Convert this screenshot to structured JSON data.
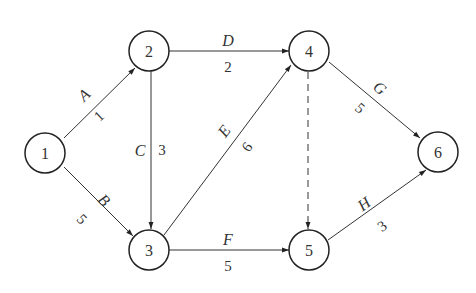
{
  "diagram": {
    "type": "activity-network",
    "nodes": [
      {
        "id": "1",
        "label": "1",
        "x": 50,
        "y": 152
      },
      {
        "id": "2",
        "label": "2",
        "x": 149,
        "y": 51
      },
      {
        "id": "3",
        "label": "3",
        "x": 149,
        "y": 250
      },
      {
        "id": "4",
        "label": "4",
        "x": 309,
        "y": 51
      },
      {
        "id": "5",
        "label": "5",
        "x": 309,
        "y": 250
      },
      {
        "id": "6",
        "label": "6",
        "x": 438,
        "y": 152
      }
    ],
    "edges": [
      {
        "id": "A",
        "name": "A",
        "weight": "1",
        "from": "1",
        "to": "2",
        "dashed": false
      },
      {
        "id": "B",
        "name": "B",
        "weight": "5",
        "from": "1",
        "to": "3",
        "dashed": false
      },
      {
        "id": "C",
        "name": "C",
        "weight": "3",
        "from": "2",
        "to": "3",
        "dashed": false
      },
      {
        "id": "D",
        "name": "D",
        "weight": "2",
        "from": "2",
        "to": "4",
        "dashed": false
      },
      {
        "id": "E",
        "name": "E",
        "weight": "6",
        "from": "3",
        "to": "4",
        "dashed": false
      },
      {
        "id": "F",
        "name": "F",
        "weight": "5",
        "from": "3",
        "to": "5",
        "dashed": false
      },
      {
        "id": "G",
        "name": "G",
        "weight": "5",
        "from": "4",
        "to": "6",
        "dashed": false
      },
      {
        "id": "H",
        "name": "H",
        "weight": "3",
        "from": "5",
        "to": "6",
        "dashed": false
      },
      {
        "id": "dummy",
        "name": "",
        "weight": "",
        "from": "4",
        "to": "5",
        "dashed": true
      }
    ]
  }
}
